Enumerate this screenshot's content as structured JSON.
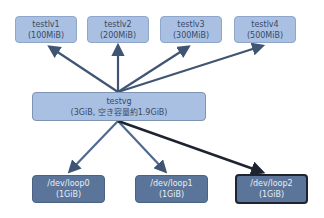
{
  "diagram": {
    "logical_volumes": [
      {
        "name": "testlv1",
        "size": "(100MiB)"
      },
      {
        "name": "testlv2",
        "size": "(200MiB)"
      },
      {
        "name": "testlv3",
        "size": "(300MiB)"
      },
      {
        "name": "testlv4",
        "size": "(500MiB)"
      }
    ],
    "volume_group": {
      "name": "testvg",
      "detail": "(3GiB, 空き容量約1.9GiB)"
    },
    "physical_volumes": [
      {
        "name": "/dev/loop0",
        "size": "(1GiB)"
      },
      {
        "name": "/dev/loop1",
        "size": "(1GiB)"
      },
      {
        "name": "/dev/loop2",
        "size": "(1GiB)"
      }
    ],
    "colors": {
      "lv_fill": "#a9c0e2",
      "vg_fill": "#a9c0e2",
      "pv_fill": "#5a7599",
      "arrow": "#3f5573",
      "arrow_highlight": "#1e2330"
    }
  }
}
